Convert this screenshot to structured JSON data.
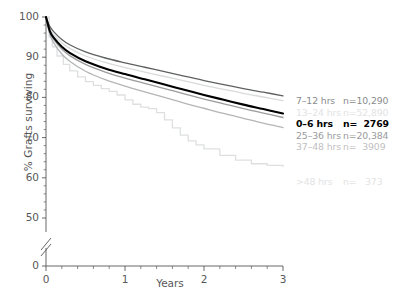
{
  "chart_data": {
    "type": "line",
    "title": "",
    "xlabel": "Years",
    "ylabel": "% Grafts surviving",
    "xlim": [
      0,
      3
    ],
    "ylim": [
      0,
      100
    ],
    "y_axis_break": true,
    "y_break_note": "axis broken between 0 and 50",
    "xticks": [
      "0",
      "1",
      "2",
      "3"
    ],
    "yticks": [
      "0",
      "50",
      "60",
      "70",
      "80",
      "90",
      "100"
    ],
    "grid": false,
    "legend_position": "right",
    "series": [
      {
        "name": "7–12 hrs",
        "count_label": "n=10,290",
        "n": 10290,
        "color": "#5f6062",
        "width": 1.3,
        "x": [
          0,
          0.05,
          0.1,
          0.2,
          0.3,
          0.5,
          0.75,
          1.0,
          1.25,
          1.5,
          1.75,
          2.0,
          2.25,
          2.5,
          2.75,
          3.0
        ],
        "y": [
          100,
          97.6,
          96.3,
          94.4,
          93.1,
          91.3,
          89.8,
          88.6,
          87.5,
          86.4,
          85.3,
          84.2,
          83.2,
          82.2,
          81.3,
          80.4
        ]
      },
      {
        "name": "13–24 hrs",
        "count_label": "n=52,890",
        "n": 52890,
        "color": "#d9dadb",
        "width": 1.3,
        "x": [
          0,
          0.05,
          0.1,
          0.2,
          0.3,
          0.5,
          0.75,
          1.0,
          1.25,
          1.5,
          1.75,
          2.0,
          2.25,
          2.5,
          2.75,
          3.0
        ],
        "y": [
          100,
          97.0,
          95.6,
          93.6,
          92.2,
          90.3,
          88.7,
          87.4,
          86.3,
          85.2,
          84.1,
          83.0,
          82.0,
          81.0,
          80.1,
          79.2
        ]
      },
      {
        "name": "0–6 hrs",
        "count_label": "n=  2769",
        "n": 2769,
        "color": "#000000",
        "width": 2.1,
        "x": [
          0,
          0.05,
          0.1,
          0.2,
          0.3,
          0.5,
          0.75,
          1.0,
          1.25,
          1.5,
          1.75,
          2.0,
          2.25,
          2.5,
          2.75,
          3.0
        ],
        "y": [
          100,
          96.4,
          94.8,
          92.6,
          91.1,
          89.0,
          87.2,
          85.8,
          84.5,
          83.2,
          81.9,
          80.6,
          79.4,
          78.2,
          77.1,
          76.0
        ]
      },
      {
        "name": "25–36 hrs",
        "count_label": "n=20,384",
        "n": 20384,
        "color": "#9a9b9d",
        "width": 1.3,
        "x": [
          0,
          0.05,
          0.1,
          0.2,
          0.3,
          0.5,
          0.75,
          1.0,
          1.25,
          1.5,
          1.75,
          2.0,
          2.25,
          2.5,
          2.75,
          3.0
        ],
        "y": [
          100,
          96.2,
          94.4,
          92.0,
          90.4,
          88.2,
          86.3,
          84.8,
          83.5,
          82.2,
          80.9,
          79.6,
          78.4,
          77.2,
          76.1,
          75.0
        ]
      },
      {
        "name": "37–48 hrs",
        "count_label": "n=  3909",
        "n": 3909,
        "color": "#b4b5b7",
        "width": 1.3,
        "x": [
          0,
          0.05,
          0.1,
          0.2,
          0.3,
          0.5,
          0.75,
          1.0,
          1.25,
          1.5,
          1.75,
          2.0,
          2.25,
          2.5,
          2.75,
          3.0
        ],
        "y": [
          100,
          95.6,
          93.5,
          90.8,
          89.0,
          86.5,
          84.4,
          82.8,
          81.4,
          80.0,
          78.6,
          77.3,
          76.0,
          74.8,
          73.6,
          72.5
        ]
      },
      {
        "name": ">48 hrs",
        "count_label": "n=   373",
        "n": 373,
        "color": "#dedfe0",
        "width": 1.3,
        "stepped": true,
        "x": [
          0,
          0.04,
          0.08,
          0.14,
          0.22,
          0.3,
          0.4,
          0.5,
          0.6,
          0.7,
          0.8,
          0.9,
          1.0,
          1.1,
          1.2,
          1.3,
          1.4,
          1.5,
          1.6,
          1.7,
          1.8,
          1.9,
          2.0,
          2.2,
          2.4,
          2.6,
          2.8,
          3.0
        ],
        "y": [
          100,
          95.0,
          92.6,
          90.3,
          88.2,
          86.6,
          85.1,
          83.9,
          83.0,
          82.2,
          81.5,
          80.6,
          79.4,
          78.3,
          77.6,
          77.2,
          76.2,
          74.4,
          72.4,
          70.6,
          69.2,
          68.2,
          67.2,
          65.6,
          64.4,
          63.5,
          63.1,
          62.8
        ]
      }
    ]
  },
  "axis": {
    "ylabel": "% Grafts surviving",
    "xlabel": "Years",
    "yticks": [
      {
        "label": "100",
        "value": 100
      },
      {
        "label": "90",
        "value": 90
      },
      {
        "label": "80",
        "value": 80
      },
      {
        "label": "70",
        "value": 70
      },
      {
        "label": "60",
        "value": 60
      },
      {
        "label": "50",
        "value": 50
      },
      {
        "label": "0",
        "value": 0
      }
    ],
    "xticks": [
      {
        "label": "0",
        "value": 0
      },
      {
        "label": "1",
        "value": 1
      },
      {
        "label": "2",
        "value": 2
      },
      {
        "label": "3",
        "value": 3
      }
    ]
  },
  "legend": {
    "rows": [
      {
        "label": "7–12 hrs",
        "count": "n=10,290",
        "color": "#8a8b8d",
        "bold": false,
        "spacer_after": false
      },
      {
        "label": "13–24 hrs",
        "count": "n=52,890",
        "color": "#e2e3e4",
        "bold": false,
        "spacer_after": false
      },
      {
        "label": "0–6 hrs",
        "count": "n=  2769",
        "color": "#000000",
        "bold": true,
        "spacer_after": false
      },
      {
        "label": "25–36 hrs",
        "count": "n=20,384",
        "color": "#9a9b9d",
        "bold": false,
        "spacer_after": false
      },
      {
        "label": "37–48 hrs",
        "count": "n=  3909",
        "color": "#bfc0c2",
        "bold": false,
        "spacer_after": true
      },
      {
        "label": ">48 hrs",
        "count": "n=   373",
        "color": "#e2e3e4",
        "bold": false,
        "spacer_after": false
      }
    ]
  },
  "colors": {
    "axis": "#58585a",
    "text": "#58585a",
    "background": "#ffffff"
  }
}
